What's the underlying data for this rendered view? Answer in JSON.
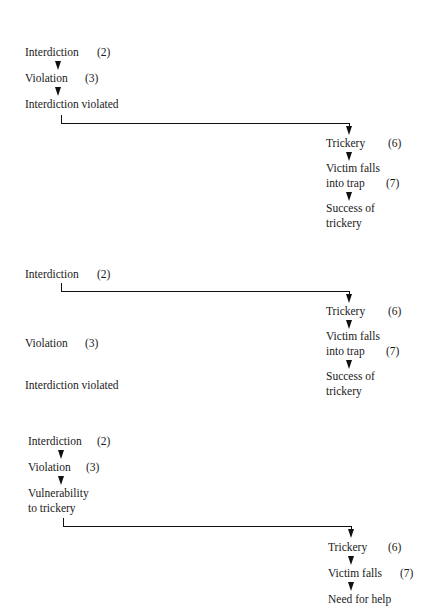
{
  "diagram": {
    "sections": [
      {
        "left": [
          {
            "label": "Interdiction",
            "num": "(2)"
          },
          {
            "label": "Violation",
            "num": "(3)"
          },
          {
            "label": "Interdiction violated",
            "num": ""
          }
        ],
        "right": [
          {
            "label": "Trickery",
            "num": "(6)"
          },
          {
            "label_line1": "Victim falls",
            "label_line2": "into trap",
            "num": "(7)"
          },
          {
            "label_line1": "Success of",
            "label_line2": "trickery",
            "num": ""
          }
        ]
      },
      {
        "left": [
          {
            "label": "Interdiction",
            "num": "(2)"
          },
          {
            "label": "Violation",
            "num": "(3)"
          },
          {
            "label": "Interdiction violated",
            "num": ""
          }
        ],
        "right": [
          {
            "label": "Trickery",
            "num": "(6)"
          },
          {
            "label_line1": "Victim falls",
            "label_line2": "into trap",
            "num": "(7)"
          },
          {
            "label_line1": "Success of",
            "label_line2": "trickery",
            "num": ""
          }
        ]
      },
      {
        "left": [
          {
            "label": "Interdiction",
            "num": "(2)"
          },
          {
            "label": "Violation",
            "num": "(3)"
          },
          {
            "label_line1": "Vulnerability",
            "label_line2": "to trickery",
            "num": ""
          }
        ],
        "right": [
          {
            "label": "Trickery",
            "num": "(6)"
          },
          {
            "label": "Victim falls",
            "num": "(7)"
          },
          {
            "label": "Need for help",
            "num": ""
          }
        ]
      }
    ]
  }
}
